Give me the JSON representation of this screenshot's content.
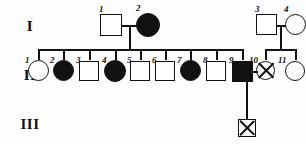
{
  "figure": {
    "type": "pedigree-chart",
    "title": "",
    "width": 306,
    "height": 144,
    "ink_color": "#111111",
    "paper_color": "#fdfdfd"
  },
  "generations": [
    {
      "id": "I",
      "label": "I"
    },
    {
      "id": "II",
      "label": "II"
    },
    {
      "id": "III",
      "label": "III"
    }
  ],
  "legend_meaning": {
    "open_square": "unaffected male",
    "filled_square": "affected male",
    "open_circle": "unaffected female",
    "filled_circle": "affected female",
    "crossed_circle": "deceased female",
    "crossed_square": "deceased male"
  },
  "individuals": [
    {
      "gen": "I",
      "num": "1",
      "sex": "male",
      "shape": "square",
      "fill": "open",
      "marked": "none"
    },
    {
      "gen": "I",
      "num": "2",
      "sex": "female",
      "shape": "circle",
      "fill": "filled",
      "marked": "none"
    },
    {
      "gen": "I",
      "num": "3",
      "sex": "male",
      "shape": "square",
      "fill": "open",
      "marked": "none"
    },
    {
      "gen": "I",
      "num": "4",
      "sex": "female",
      "shape": "circle",
      "fill": "open",
      "marked": "none"
    },
    {
      "gen": "II",
      "num": "1",
      "sex": "female",
      "shape": "circle",
      "fill": "open",
      "marked": "none"
    },
    {
      "gen": "II",
      "num": "2",
      "sex": "female",
      "shape": "circle",
      "fill": "filled",
      "marked": "none"
    },
    {
      "gen": "II",
      "num": "3",
      "sex": "male",
      "shape": "square",
      "fill": "open",
      "marked": "none"
    },
    {
      "gen": "II",
      "num": "4",
      "sex": "female",
      "shape": "circle",
      "fill": "filled",
      "marked": "none"
    },
    {
      "gen": "II",
      "num": "5",
      "sex": "male",
      "shape": "square",
      "fill": "open",
      "marked": "none"
    },
    {
      "gen": "II",
      "num": "6",
      "sex": "male",
      "shape": "square",
      "fill": "open",
      "marked": "none"
    },
    {
      "gen": "II",
      "num": "7",
      "sex": "female",
      "shape": "circle",
      "fill": "filled",
      "marked": "none"
    },
    {
      "gen": "II",
      "num": "8",
      "sex": "male",
      "shape": "square",
      "fill": "open",
      "marked": "none"
    },
    {
      "gen": "II",
      "num": "9",
      "sex": "male",
      "shape": "square",
      "fill": "filled",
      "marked": "none"
    },
    {
      "gen": "II",
      "num": "10",
      "sex": "female",
      "shape": "circle",
      "fill": "open",
      "marked": "cross"
    },
    {
      "gen": "II",
      "num": "11",
      "sex": "female",
      "shape": "circle",
      "fill": "open",
      "marked": "none"
    },
    {
      "gen": "III",
      "num": "",
      "sex": "male",
      "shape": "square",
      "fill": "open",
      "marked": "cross"
    }
  ],
  "matings": [
    {
      "parents": [
        "I-1",
        "I-2"
      ],
      "children": [
        "II-1",
        "II-2",
        "II-3",
        "II-4",
        "II-5",
        "II-6",
        "II-7",
        "II-8",
        "II-9"
      ]
    },
    {
      "parents": [
        "I-3",
        "I-4"
      ],
      "children": [
        "II-10",
        "II-11"
      ]
    },
    {
      "parents": [
        "II-9",
        "II-10"
      ],
      "children": [
        "III-1"
      ]
    }
  ]
}
